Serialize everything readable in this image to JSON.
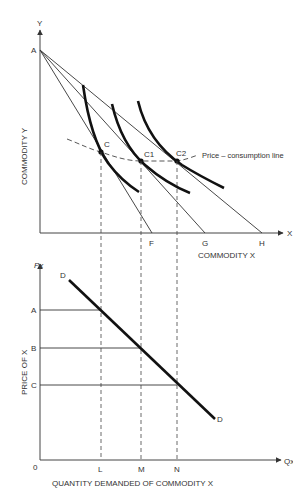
{
  "top_panel": {
    "y_axis_symbol": "Y",
    "x_axis_symbol": "X",
    "y_axis_title": "COMMODITY Y",
    "x_axis_title": "COMMODITY X",
    "origin_intercept_label": "A",
    "x_intercepts": [
      "F",
      "G",
      "H"
    ],
    "equilibrium_points": [
      "C",
      "C1",
      "C2"
    ],
    "curve_label": "Price – consumption line"
  },
  "bottom_panel": {
    "y_axis_symbol": "Px",
    "x_axis_symbol": "Qx",
    "y_axis_title": "PRICE OF X",
    "x_axis_title": "QUANTITY DEMANDED OF COMMODITY X",
    "origin_label": "0",
    "price_levels": [
      "A",
      "B",
      "C"
    ],
    "quantity_levels": [
      "L",
      "M",
      "N"
    ],
    "demand_curve_label_top": "D",
    "demand_curve_label_bottom": "D"
  },
  "colors": {
    "line": "#333333",
    "curve": "#111111",
    "axis": "#444444"
  }
}
